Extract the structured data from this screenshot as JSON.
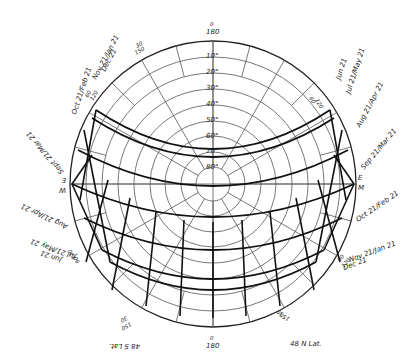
{
  "diagram": {
    "type": "sun-path-diagram",
    "latitude_label": "48 N Lat.",
    "latitude_label_mirrored": "48 S Lat.",
    "center": [
      213,
      184
    ],
    "radius": 143,
    "altitude_rings": [
      "10°",
      "20°",
      "30°",
      "40°",
      "50°",
      "60°",
      "70°",
      "80°"
    ],
    "top_azimuth": {
      "outer": "0",
      "inner": "180"
    },
    "bottom_azimuth": {
      "outer": "0",
      "inner": "180"
    },
    "azimuth_marks": {
      "upper_left": {
        "a": "30",
        "b": "150"
      },
      "upper_right": {
        "a": "30",
        "b": "150"
      },
      "left_upper": {
        "a": "60",
        "b": "120"
      },
      "right_upper": {
        "a": "60",
        "b": "120"
      },
      "left_lower": {
        "a": "90",
        "b": "120"
      },
      "right_lower": {
        "a": "90",
        "b": "120"
      },
      "lower_left": {
        "a": "30",
        "b": "150"
      },
      "lower_right": {
        "a": "30",
        "b": "150"
      }
    },
    "compass": {
      "west": "W",
      "east": "E",
      "west_mirror": "E",
      "east_mirror": "M"
    },
    "date_labels_left": [
      "Nov 21/Jan 21",
      "Dec 21",
      "Oct 21/Feb 21",
      "Sept 21/Mar 21",
      "Aug 21/Apr 21",
      "Jul 21/May 21",
      "Jun 21"
    ],
    "date_labels_right": [
      "Jun 21",
      "Jul 21/May 21",
      "Aug 21/Apr 21",
      "Sep 21/Mar 21",
      "Oct 21/Feb 21",
      "Nov 21/Jan 21",
      "Dec 21"
    ],
    "hour_labels": [
      "4/8",
      "5/7",
      "6/6",
      "7/5",
      "8/4",
      "9/3",
      "10/2",
      "11/1",
      "12/12",
      "1/11",
      "2/10",
      "3/9",
      "4/8",
      "5/7",
      "6/6"
    ]
  }
}
